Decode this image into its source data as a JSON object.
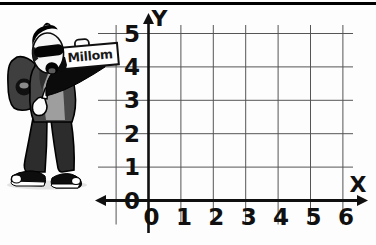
{
  "figure": {
    "sign": {
      "label": "Millom"
    }
  },
  "chart_data": {
    "type": "scatter",
    "title": "",
    "xlabel": "X",
    "ylabel": "Y",
    "xlim": [
      0,
      6
    ],
    "ylim": [
      0,
      5
    ],
    "x_ticks": [
      "0",
      "1",
      "2",
      "3",
      "4",
      "5",
      "6"
    ],
    "y_ticks": [
      "0",
      "1",
      "2",
      "3",
      "4",
      "5"
    ],
    "grid": true,
    "legend": false,
    "series": []
  },
  "colors": {
    "background": "#fdfdfd",
    "top_rule": "#000000",
    "grid_line": "#555555",
    "axis": "#101010",
    "tick_label": "#101010",
    "sign_background": "#ffffff",
    "sign_border": "#111111",
    "character_ink": "#0b0b0b"
  }
}
